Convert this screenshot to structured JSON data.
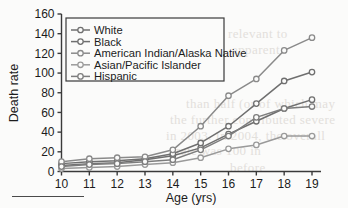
{
  "figure": {
    "background_color": "#fbfbfa",
    "axis_color": "#3a3a3a",
    "footnote_rule": true
  },
  "chart_data": {
    "type": "line",
    "title": "",
    "subtitle": "",
    "xlabel": "Age (yrs)",
    "ylabel": "Death rate",
    "x": [
      10,
      11,
      12,
      13,
      14,
      15,
      16,
      17,
      18,
      19
    ],
    "xticklabels": [
      "10",
      "11",
      "12",
      "13",
      "14",
      "15",
      "16",
      "17",
      "18",
      "19"
    ],
    "xlim": [
      10,
      19
    ],
    "ylim": [
      0,
      160
    ],
    "yticks": [
      0,
      20,
      40,
      60,
      80,
      100,
      120,
      140,
      160
    ],
    "yticklabels": [
      "0",
      "20",
      "40",
      "60",
      "80",
      "100",
      "120",
      "140",
      "160"
    ],
    "grid": false,
    "legend_position": "upper left",
    "marker": "circle-open",
    "series": [
      {
        "name": "White",
        "color": "#6f6f6f",
        "values": [
          6,
          8,
          9,
          12,
          16,
          24,
          38,
          51,
          64,
          73
        ]
      },
      {
        "name": "Black",
        "color": "#6f6f6f",
        "values": [
          8,
          10,
          11,
          13,
          18,
          29,
          46,
          69,
          92,
          101
        ]
      },
      {
        "name": "American Indian/Alaska Native",
        "color": "#8a8a8a",
        "values": [
          10,
          13,
          14,
          15,
          22,
          46,
          77,
          94,
          123,
          136
        ]
      },
      {
        "name": "Asian/Pacific Islander",
        "color": "#9a9a9a",
        "values": [
          3,
          4,
          5,
          7,
          9,
          14,
          23,
          27,
          36,
          36
        ]
      },
      {
        "name": "Hispanic",
        "color": "#7d7d7d",
        "values": [
          5,
          7,
          8,
          10,
          12,
          22,
          36,
          55,
          64,
          66
        ]
      }
    ]
  },
  "legend": {
    "items": [
      {
        "label": "White"
      },
      {
        "label": "Black"
      },
      {
        "label": "American Indian/Alaska Native"
      },
      {
        "label": "Asian/Pacific Islander"
      },
      {
        "label": "Hispanic"
      }
    ]
  },
  "bleed_text": [
    {
      "text": "more relevant to",
      "x": 196,
      "y": 26
    },
    {
      "text": "apparent",
      "x": 232,
      "y": 42
    },
    {
      "text": "than half (or of which may",
      "x": 186,
      "y": 96
    },
    {
      "text": "the further contributed severe",
      "x": 170,
      "y": 112
    },
    {
      "text": "in 2003. In 2004, the overall",
      "x": 166,
      "y": 128
    },
    {
      "text": "rate was 100 in",
      "x": 176,
      "y": 143
    },
    {
      "text": "before",
      "x": 230,
      "y": 160
    }
  ]
}
